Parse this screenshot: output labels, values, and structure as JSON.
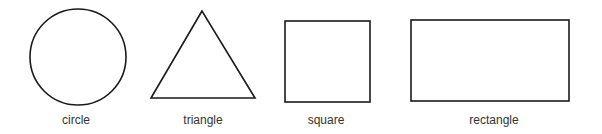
{
  "figure": {
    "shapes": [
      {
        "kind": "circle",
        "label": "circle"
      },
      {
        "kind": "triangle",
        "label": "triangle"
      },
      {
        "kind": "square",
        "label": "square"
      },
      {
        "kind": "rectangle",
        "label": "rectangle"
      }
    ],
    "colors": {
      "stroke": "#1a1a1a",
      "text": "#333333",
      "background": "#ffffff"
    }
  }
}
